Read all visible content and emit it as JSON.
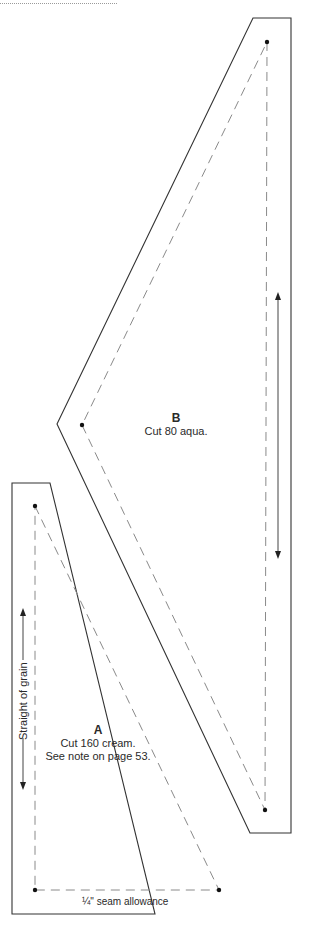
{
  "pieces": {
    "B": {
      "letter": "B",
      "instruction": "Cut 80 aqua."
    },
    "A": {
      "letter": "A",
      "instruction": "Cut 160 cream.",
      "note": "See note on page 53."
    }
  },
  "annotations": {
    "grain_label": "Straight of grain",
    "seam_label": "¼\" seam allowance"
  },
  "colors": {
    "outline": "#333333",
    "dashed": "#8a8a8a",
    "text": "#2a2a2a"
  }
}
